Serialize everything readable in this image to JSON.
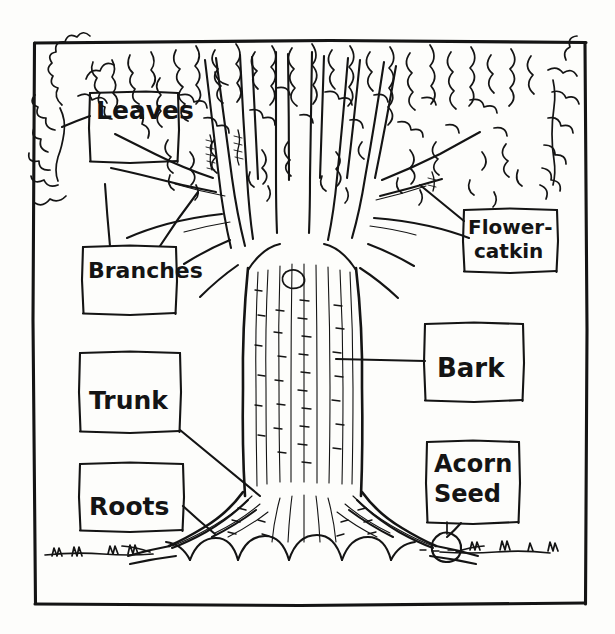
{
  "diagram": {
    "style": "hand-drawn black ink line drawing on off-white paper",
    "background_color": "#fdfdfb",
    "ink_color": "#141414",
    "frame": {
      "x": 33,
      "y": 40,
      "width": 552,
      "height": 565
    },
    "labels": [
      {
        "id": "leaves",
        "lines": [
          "Leaves"
        ],
        "box": {
          "x": 90,
          "y": 92,
          "width": 88,
          "height": 70
        },
        "text_x": 96,
        "text_y": 119,
        "font_size": 25,
        "leader": "from box left edge up-left to canopy foliage"
      },
      {
        "id": "branches",
        "lines": [
          "Branches"
        ],
        "box": {
          "x": 83,
          "y": 246,
          "width": 93,
          "height": 68
        },
        "text_x": 88,
        "text_y": 278,
        "font_size": 22,
        "leader": "two lines from box top to branch forks"
      },
      {
        "id": "trunk",
        "lines": [
          "Trunk"
        ],
        "box": {
          "x": 80,
          "y": 352,
          "width": 100,
          "height": 80
        },
        "text_x": 89,
        "text_y": 409,
        "font_size": 25,
        "leader": "from box bottom-right diagonally down to trunk base"
      },
      {
        "id": "roots",
        "lines": [
          "Roots"
        ],
        "box": {
          "x": 80,
          "y": 463,
          "width": 103,
          "height": 68
        },
        "text_x": 89,
        "text_y": 515,
        "font_size": 25,
        "leader": "from box right edge to root flare"
      },
      {
        "id": "flower-catkin",
        "lines": [
          "Flower-",
          "catkin"
        ],
        "box": {
          "x": 464,
          "y": 209,
          "width": 93,
          "height": 63
        },
        "text_x": 468,
        "text_y": 234,
        "font_size": 20,
        "line_height": 24,
        "leader": "from box left edge up-left to hanging catkin"
      },
      {
        "id": "bark",
        "lines": [
          "Bark"
        ],
        "box": {
          "x": 425,
          "y": 323,
          "width": 98,
          "height": 78
        },
        "text_x": 437,
        "text_y": 377,
        "font_size": 26,
        "leader": "from box left edge horizontally to trunk surface"
      },
      {
        "id": "acorn-seed",
        "lines": [
          "Acorn",
          "Seed"
        ],
        "box": {
          "x": 427,
          "y": 441,
          "width": 92,
          "height": 82
        },
        "text_x": 434,
        "text_y": 472,
        "font_size": 24,
        "line_height": 30,
        "leader": "from box bottom down to acorn on ground line"
      }
    ],
    "parts_depicted": [
      "canopy of lobed oak leaves",
      "branches forking from trunk",
      "textured trunk with vertical bark lines",
      "buttressed root flare",
      "hanging flower catkins",
      "acorn seed at ground level",
      "ground line with grass tufts"
    ]
  }
}
